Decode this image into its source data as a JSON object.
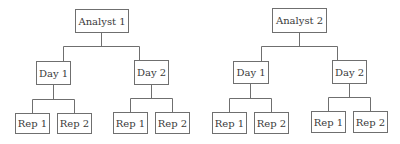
{
  "diagram": {
    "type": "hierarchy",
    "line_color": "#6f6f6f",
    "text_color": "#3a3a3a",
    "trees": [
      {
        "label": "Analyst 1",
        "children": [
          {
            "label": "Day 1",
            "children": [
              {
                "label": "Rep 1"
              },
              {
                "label": "Rep 2"
              }
            ]
          },
          {
            "label": "Day 2",
            "children": [
              {
                "label": "Rep 1"
              },
              {
                "label": "Rep 2"
              }
            ]
          }
        ]
      },
      {
        "label": "Analyst 2",
        "children": [
          {
            "label": "Day 1",
            "children": [
              {
                "label": "Rep 1"
              },
              {
                "label": "Rep 2"
              }
            ]
          },
          {
            "label": "Day 2",
            "children": [
              {
                "label": "Rep 1"
              },
              {
                "label": "Rep 2"
              }
            ]
          }
        ]
      }
    ]
  }
}
